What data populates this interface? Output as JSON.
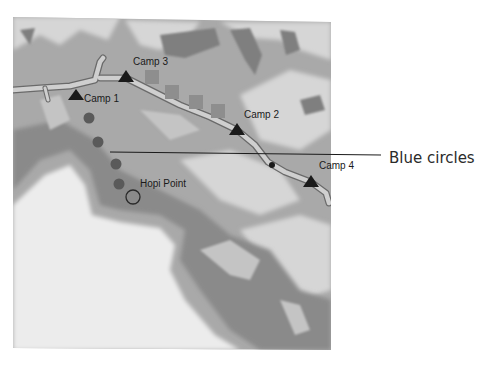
{
  "map": {
    "camps": [
      {
        "label": "Camp 1",
        "x": 76,
        "y": 96
      },
      {
        "label": "Camp 3",
        "x": 126,
        "y": 77
      },
      {
        "label": "Camp 2",
        "x": 237,
        "y": 130
      },
      {
        "label": "Camp 4",
        "x": 311,
        "y": 182
      }
    ],
    "hopi_point": {
      "label": "Hopi Point",
      "x": 133,
      "y": 197
    },
    "circles": [
      {
        "x": 89,
        "y": 118
      },
      {
        "x": 98,
        "y": 142
      },
      {
        "x": 116,
        "y": 164
      },
      {
        "x": 119,
        "y": 184
      }
    ],
    "squares": [
      {
        "x": 152,
        "y": 77
      },
      {
        "x": 172,
        "y": 92
      },
      {
        "x": 196,
        "y": 102
      },
      {
        "x": 218,
        "y": 111
      }
    ],
    "callout": {
      "label": "Blue circles"
    },
    "colors": {
      "background": "#ffffff",
      "plateau": "#e6e6e6",
      "slope": "#8c8c8c",
      "canyon_mid": "#b0b0b0",
      "river": "#c8c8c8",
      "river_edge": "#6a6a6a",
      "marker": "#1a1a1a",
      "circle": "#5a5a5a",
      "square": "#8e8e8e"
    }
  }
}
